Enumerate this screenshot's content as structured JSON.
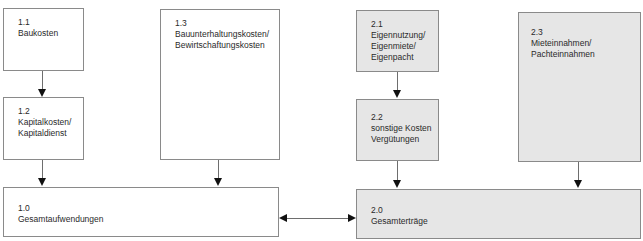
{
  "diagram": {
    "colors": {
      "border": "#8a8a8a",
      "gray_fill": "#e6e6e6",
      "arrow": "#111111"
    },
    "nodes": {
      "n1_1": {
        "id": "1.1",
        "lines": [
          "Baukosten"
        ]
      },
      "n1_2": {
        "id": "1.2",
        "lines": [
          "Kapitalkosten/",
          "Kapitaldienst"
        ]
      },
      "n1_3": {
        "id": "1.3",
        "lines": [
          "Bauunterhaltungskosten/",
          "Bewirtschaftungskosten"
        ]
      },
      "n1_0": {
        "id": "1.0",
        "lines": [
          "Gesamtaufwendungen"
        ]
      },
      "n2_1": {
        "id": "2.1",
        "lines": [
          "Eigennutzung/",
          "Eigenmiete/",
          "Eigenpacht"
        ]
      },
      "n2_2": {
        "id": "2.2",
        "lines": [
          "sonstige Kosten",
          "Vergütungen"
        ]
      },
      "n2_3": {
        "id": "2.3",
        "lines": [
          "Mieteinnahmen/",
          "Pachteinnahmen"
        ]
      },
      "n2_0": {
        "id": "2.0",
        "lines": [
          "Gesamterträge"
        ]
      }
    },
    "edges": [
      {
        "from": "1.1",
        "to": "1.2"
      },
      {
        "from": "1.2",
        "to": "1.0"
      },
      {
        "from": "1.3",
        "to": "1.0"
      },
      {
        "from": "2.1",
        "to": "2.2"
      },
      {
        "from": "2.2",
        "to": "2.0"
      },
      {
        "from": "2.3",
        "to": "2.0"
      },
      {
        "from": "1.0",
        "to": "2.0",
        "bidirectional": true
      }
    ]
  }
}
